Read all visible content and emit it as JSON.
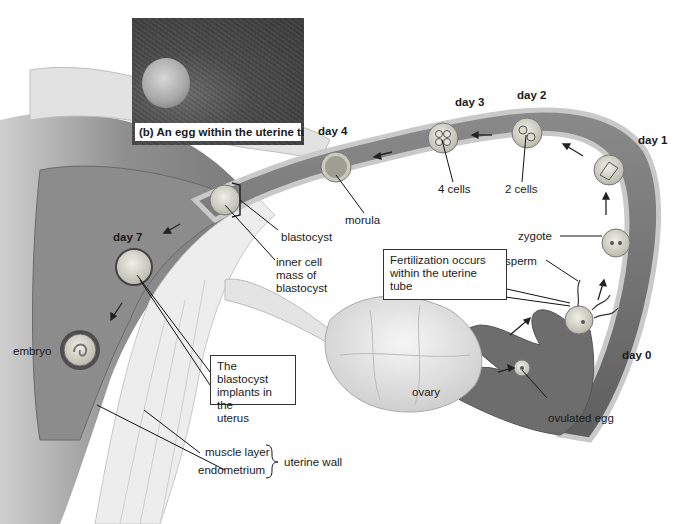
{
  "figure": {
    "inset_photo": {
      "caption": "(b) An egg within the uterine tube"
    },
    "day_labels": {
      "day0": "day 0",
      "day1": "day 1",
      "day2": "day 2",
      "day3": "day 3",
      "day4": "day 4",
      "day7": "day 7"
    },
    "stage_labels": {
      "ovulated_egg": "ovulated egg",
      "sperm": "sperm",
      "zygote": "zygote",
      "two_cells": "2 cells",
      "four_cells": "4 cells",
      "morula": "morula",
      "blastocyst": "blastocyst",
      "inner_cell_mass": [
        "inner cell",
        "mass of",
        "blastocyst"
      ],
      "embryo": "embryo",
      "ovary": "ovary"
    },
    "callouts": {
      "fertilization": [
        "Fertilization occurs",
        "within the uterine",
        "tube"
      ],
      "implantation": [
        "The blastocyst",
        "implants in the",
        "uterus"
      ]
    },
    "uterine_wall": {
      "muscle_layer": "muscle layer",
      "endometrium": "endometrium",
      "group_label": "uterine wall"
    },
    "colors": {
      "tube_fill": "#7a7a7a",
      "tube_wall": "#bdbdbd",
      "uterus_fill": "#9a9a9a",
      "muscle": "#e6e6e6",
      "ovary": "#ececec",
      "cell": "#d6d6c8",
      "ink": "#1a1a1a"
    }
  }
}
